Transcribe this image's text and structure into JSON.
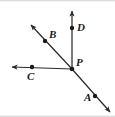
{
  "figure": {
    "kind": "geometry-diagram",
    "width": 115,
    "height": 117,
    "background_color": "#ffffff",
    "stroke_color": "#2b2b2b",
    "label_color": "#1a1a1a",
    "vertex": {
      "id": "P",
      "label": "P",
      "x": 72,
      "y": 69
    },
    "points": [
      {
        "id": "A",
        "label": "A",
        "dot_x": 95,
        "dot_y": 96,
        "label_x": 85,
        "label_y": 93
      },
      {
        "id": "B",
        "label": "B",
        "dot_x": 45,
        "dot_y": 41,
        "label_x": 49,
        "label_y": 30
      },
      {
        "id": "C",
        "label": "C",
        "dot_x": 32,
        "dot_y": 67,
        "label_x": 27,
        "label_y": 71
      },
      {
        "id": "D",
        "label": "D",
        "dot_x": 72,
        "dot_y": 28,
        "label_x": 76,
        "label_y": 22
      }
    ],
    "rays": [
      {
        "id": "ray-PD",
        "from": "P",
        "through": "D",
        "tip_x": 72,
        "tip_y": 8,
        "arrow": true
      },
      {
        "id": "ray-PB",
        "from": "P",
        "through": "B",
        "tip_x": 28,
        "tip_y": 22,
        "arrow": true
      },
      {
        "id": "ray-PC",
        "from": "P",
        "through": "C",
        "tip_x": 9,
        "tip_y": 67,
        "arrow": true
      },
      {
        "id": "ray-PA",
        "from": "P",
        "through": "A",
        "tip_x": 113,
        "tip_y": 115,
        "arrow": true
      }
    ],
    "vertex_label_position": {
      "x": 76,
      "y": 59
    }
  }
}
